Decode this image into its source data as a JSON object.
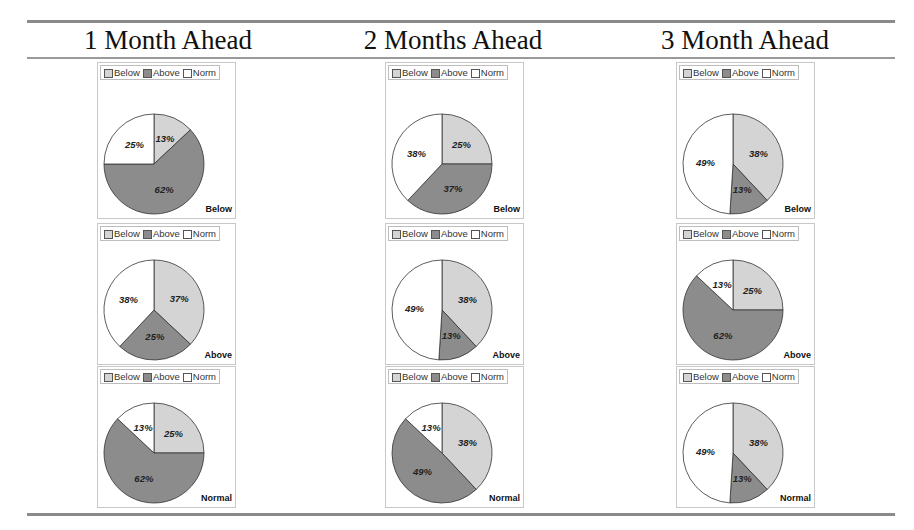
{
  "columns": [
    {
      "title": "1 Month Ahead"
    },
    {
      "title": "2 Months Ahead"
    },
    {
      "title": "3 Month Ahead"
    }
  ],
  "legend": [
    {
      "label": "Below",
      "color": "#d4d4d4"
    },
    {
      "label": "Above",
      "color": "#8c8c8c"
    },
    {
      "label": "Norm",
      "color": "#ffffff"
    }
  ],
  "chart_data": [
    {
      "type": "pie",
      "column": "1 Month Ahead",
      "row": "Below",
      "categories": [
        "Below",
        "Above",
        "Norm"
      ],
      "values": [
        13,
        62,
        25
      ]
    },
    {
      "type": "pie",
      "column": "2 Months Ahead",
      "row": "Below",
      "categories": [
        "Below",
        "Above",
        "Norm"
      ],
      "values": [
        25,
        37,
        38
      ]
    },
    {
      "type": "pie",
      "column": "3 Month Ahead",
      "row": "Below",
      "categories": [
        "Below",
        "Above",
        "Norm"
      ],
      "values": [
        38,
        13,
        49
      ]
    },
    {
      "type": "pie",
      "column": "1 Month Ahead",
      "row": "Above",
      "categories": [
        "Below",
        "Above",
        "Norm"
      ],
      "values": [
        37,
        25,
        38
      ]
    },
    {
      "type": "pie",
      "column": "2 Months Ahead",
      "row": "Above",
      "categories": [
        "Below",
        "Above",
        "Norm"
      ],
      "values": [
        38,
        13,
        49
      ]
    },
    {
      "type": "pie",
      "column": "3 Month Ahead",
      "row": "Above",
      "categories": [
        "Below",
        "Above",
        "Norm"
      ],
      "values": [
        25,
        62,
        13
      ]
    },
    {
      "type": "pie",
      "column": "1 Month Ahead",
      "row": "Normal",
      "categories": [
        "Below",
        "Above",
        "Norm"
      ],
      "values": [
        25,
        62,
        13
      ]
    },
    {
      "type": "pie",
      "column": "2 Months Ahead",
      "row": "Normal",
      "categories": [
        "Below",
        "Above",
        "Norm"
      ],
      "values": [
        38,
        49,
        13
      ]
    },
    {
      "type": "pie",
      "column": "3 Month Ahead",
      "row": "Normal",
      "categories": [
        "Below",
        "Above",
        "Norm"
      ],
      "values": [
        38,
        13,
        49
      ]
    }
  ],
  "panels": [
    {
      "caption": "Below",
      "labels": [
        "13%",
        "62%",
        "25%"
      ]
    },
    {
      "caption": "Below",
      "labels": [
        "25%",
        "37%",
        "38%"
      ]
    },
    {
      "caption": "Below",
      "labels": [
        "38%",
        "13%",
        "49%"
      ]
    },
    {
      "caption": "Above",
      "labels": [
        "37%",
        "25%",
        "38%"
      ]
    },
    {
      "caption": "Above",
      "labels": [
        "38%",
        "13%",
        "49%"
      ]
    },
    {
      "caption": "Above",
      "labels": [
        "25%",
        "62%",
        "13%"
      ]
    },
    {
      "caption": "Normal",
      "labels": [
        "25%",
        "62%",
        "13%"
      ]
    },
    {
      "caption": "Normal",
      "labels": [
        "38%",
        "49%",
        "13%"
      ]
    },
    {
      "caption": "Normal",
      "labels": [
        "38%",
        "13%",
        "49%"
      ]
    }
  ]
}
